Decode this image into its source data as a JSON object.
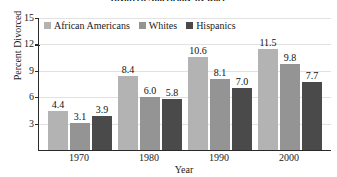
{
  "chart_data": {
    "type": "bar",
    "title": "Divorced Americans, by Race",
    "xlabel": "Year",
    "ylabel": "Percent Divorced",
    "categories": [
      "1970",
      "1980",
      "1990",
      "2000"
    ],
    "ylim": [
      0,
      15
    ],
    "yticks": [
      "15",
      "12",
      "9",
      "6",
      "3"
    ],
    "grid": true,
    "legend_position": "top-left-inside",
    "series": [
      {
        "name": "African Americans",
        "color": "#b3b3b3",
        "values": [
          4.4,
          8.4,
          10.6,
          11.5
        ],
        "labels": [
          "4.4",
          "8.4",
          "10.6",
          "11.5"
        ]
      },
      {
        "name": "Whites",
        "color": "#949494",
        "values": [
          3.1,
          6.0,
          8.1,
          9.8
        ],
        "labels": [
          "3.1",
          "6.0",
          "8.1",
          "9.8"
        ]
      },
      {
        "name": "Hispanics",
        "color": "#4a4a4a",
        "values": [
          3.9,
          5.8,
          7.0,
          7.7
        ],
        "labels": [
          "3.9",
          "5.8",
          "7.0",
          "7.7"
        ]
      }
    ]
  }
}
